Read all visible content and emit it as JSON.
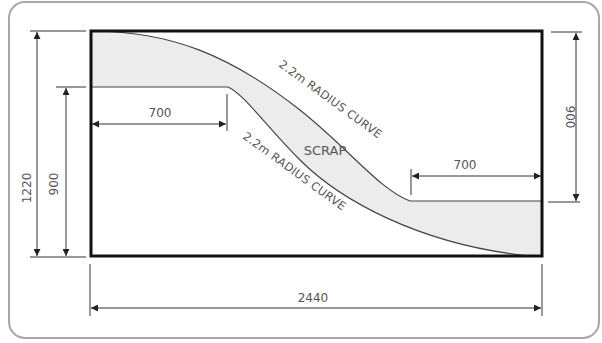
{
  "diagram": {
    "colors": {
      "frame": "#a8a8a8",
      "sheet_outline": "#111111",
      "scrap_fill": "#ececec",
      "dim_line": "#333333",
      "text": "#555555"
    },
    "sheet": {
      "width_mm": 2440,
      "height_mm": 1220
    },
    "dimensions": {
      "overall_width": "2440",
      "overall_height": "1220",
      "left_height": "900",
      "right_height": "900",
      "left_plateau_width": "700",
      "right_plateau_width": "700"
    },
    "labels": {
      "upper_curve": "2.2m RADIUS CURVE",
      "lower_curve": "2.2m RADIUS CURVE",
      "scrap": "SCRAP"
    }
  }
}
